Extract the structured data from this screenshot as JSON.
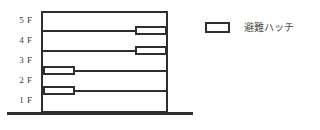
{
  "diagram": {
    "type": "building-cross-section",
    "floors": [
      {
        "label": "5 F"
      },
      {
        "label": "4 F"
      },
      {
        "label": "3 F"
      },
      {
        "label": "2 F"
      },
      {
        "label": "1 F"
      }
    ],
    "building": {
      "left": 41,
      "top": 11,
      "width": 127,
      "height": 102,
      "outline_color": "#2e2e2e"
    },
    "floor_lines": [
      {
        "y": 30
      },
      {
        "y": 50
      },
      {
        "y": 70
      },
      {
        "y": 90
      }
    ],
    "ground_line": {
      "left": 7,
      "top": 112,
      "width": 186,
      "color": "#2e2e2e"
    },
    "hatches": [
      {
        "name": "hatch-5f-4f",
        "left": 135,
        "top": 26,
        "side": "right"
      },
      {
        "name": "hatch-4f-3f",
        "left": 135,
        "top": 46,
        "side": "right"
      },
      {
        "name": "hatch-3f-2f",
        "left": 43,
        "top": 66,
        "side": "left"
      },
      {
        "name": "hatch-2f-1f",
        "left": 43,
        "top": 86,
        "side": "left"
      }
    ],
    "label_positions": [
      20,
      40,
      60,
      80,
      100
    ]
  },
  "legend": {
    "label": "避難ハッチ",
    "swatch_fill": "#ffffff",
    "swatch_border": "#2e2e2e"
  }
}
